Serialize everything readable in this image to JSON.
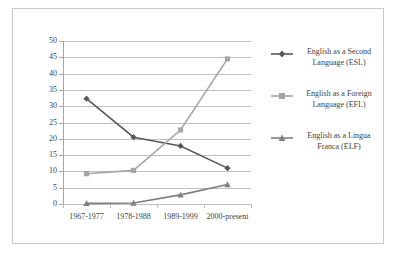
{
  "chart_data": {
    "type": "line",
    "title": "",
    "subtitle": "",
    "xlabel": "",
    "ylabel": "",
    "categories": [
      "1967-1977",
      "1978-1988",
      "1989-1999",
      "2000-present"
    ],
    "ylim": [
      0,
      50
    ],
    "y_ticks": [
      0,
      5,
      10,
      15,
      20,
      25,
      30,
      35,
      40,
      45,
      50
    ],
    "grid": true,
    "legend_position": "right",
    "series": [
      {
        "name": "English as a Second Language (ESL)",
        "short_name": "ESL",
        "legend_line1": "English as a Second",
        "legend_line2": "Language (ESL)",
        "color": "#595959",
        "marker": "diamond",
        "values": [
          32.3,
          20.5,
          17.8,
          11.0
        ]
      },
      {
        "name": "English as a Foreign Language (EFL)",
        "short_name": "EFL",
        "legend_line1": "English as a Foreign",
        "legend_line2": "Language (EFL)",
        "color": "#a6a6a6",
        "marker": "square",
        "values": [
          9.3,
          10.3,
          22.7,
          44.5
        ]
      },
      {
        "name": "English as a Lingua Franca (ELF)",
        "short_name": "ELF",
        "legend_line1": "English as a Lingua",
        "legend_line2": "Franca (ELF)",
        "color": "#7f7f7f",
        "marker": "triangle",
        "values": [
          0.2,
          0.3,
          2.8,
          6.0
        ]
      }
    ]
  },
  "axis": {
    "y_tick_labels": [
      "0",
      "5",
      "10",
      "15",
      "20",
      "25",
      "30",
      "35",
      "40",
      "45",
      "50"
    ],
    "x_tick_labels": [
      "1967-1977",
      "1978-1988",
      "1989-1999",
      "2000-present"
    ]
  },
  "legend": {
    "entries": [
      {
        "line1": "English as a Second",
        "line2": "Language (ESL)"
      },
      {
        "line1": "English as a Foreign",
        "line2": "Language (EFL)"
      },
      {
        "line1": "English as a Lingua",
        "line2": "Franca (ELF)"
      }
    ]
  },
  "style": {
    "frame_color": "#c9c9c9",
    "gridline_color": "#bfbfbf",
    "axis_color": "#a6a6a6",
    "text_color": "#3f3f3f",
    "background": "#ffffff"
  }
}
